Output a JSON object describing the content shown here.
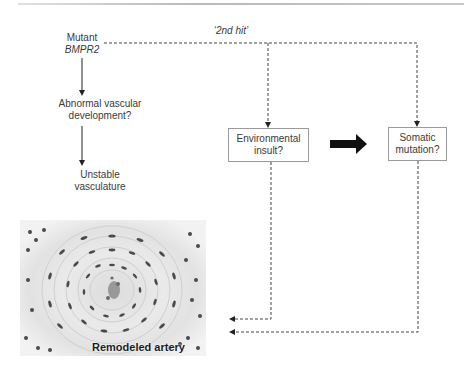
{
  "figure": {
    "type": "pathogenesis-flow-diagram",
    "colors": {
      "text": "#3a3a3a",
      "box_border": "#9a9a9a",
      "dashed_line": "#444444",
      "solid_arrow": "#111111",
      "rule": "#b8b8b8"
    }
  },
  "nodes": {
    "mutant": {
      "line1": "Mutant",
      "line2": "BMPR2"
    },
    "abnormal": {
      "line1": "Abnormal vascular",
      "line2": "development?"
    },
    "unstable": {
      "line1": "Unstable",
      "line2": "vasculature"
    },
    "environmental": {
      "line1": "Environmental",
      "line2": "insult?"
    },
    "somatic": {
      "line1": "Somatic",
      "line2": "mutation?"
    }
  },
  "labels": {
    "second_hit": "‘2nd hit’",
    "micrograph_caption": "Remodeled artery"
  },
  "edges": [
    {
      "from": "mutant",
      "to": "abnormal",
      "style": "solid"
    },
    {
      "from": "abnormal",
      "to": "unstable",
      "style": "solid"
    },
    {
      "from": "mutant",
      "to": "environmental",
      "style": "dashed",
      "label": "‘2nd hit’"
    },
    {
      "from": "mutant",
      "to": "somatic",
      "style": "dashed",
      "label": "‘2nd hit’"
    },
    {
      "from": "environmental",
      "to": "somatic",
      "style": "thick-bold"
    },
    {
      "from": "environmental",
      "to": "remodeled-artery",
      "style": "dashed"
    },
    {
      "from": "somatic",
      "to": "remodeled-artery",
      "style": "dashed"
    }
  ]
}
